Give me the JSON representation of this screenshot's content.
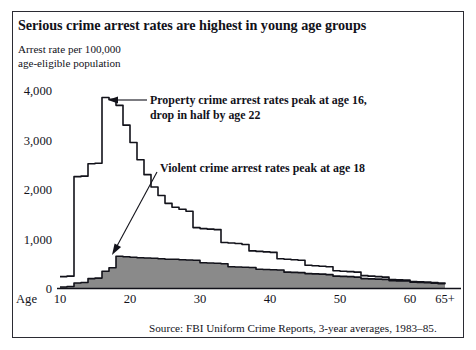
{
  "figure": {
    "title": "Serious crime arrest rates are highest in young age groups",
    "axis_caption_line1": "Arrest rate per 100,000",
    "axis_caption_line2": "age-eligible population",
    "source": "Source: FBI Uniform Crime Reports, 3-year averages, 1983–85.",
    "border_color": "#2b2b33",
    "background_color": "#ffffff"
  },
  "annotations": [
    {
      "id": "property-callout",
      "line1": "Property crime arrest rates peak at age 16,",
      "line2": "drop in half by age 22"
    },
    {
      "id": "violent-callout",
      "line1": "Violent crime arrest rates peak at age 18"
    }
  ],
  "chart_data": {
    "type": "line",
    "title": "Serious crime arrest rates are highest in young age groups",
    "xlabel": "Age",
    "ylabel": "Arrest rate per 100,000 age-eligible population",
    "xlim": [
      10,
      66
    ],
    "ylim": [
      0,
      4300
    ],
    "grid": false,
    "legend": "none",
    "x_prefix_label": "Age",
    "x_ticks": [
      10,
      20,
      30,
      40,
      50,
      60,
      65
    ],
    "x_tick_labels": [
      "10",
      "20",
      "30",
      "40",
      "50",
      "60",
      "65+"
    ],
    "y_ticks": [
      0,
      1000,
      2000,
      3000,
      4000
    ],
    "y_tick_labels": [
      "0",
      "1,000",
      "2,000",
      "3,000",
      "4,000"
    ],
    "x": [
      10,
      11,
      12,
      13,
      14,
      15,
      16,
      17,
      18,
      19,
      20,
      21,
      22,
      23,
      24,
      25,
      26,
      27,
      28,
      29,
      30,
      31,
      32,
      33,
      34,
      35,
      36,
      37,
      38,
      39,
      40,
      41,
      42,
      43,
      44,
      45,
      46,
      47,
      48,
      49,
      50,
      51,
      52,
      53,
      54,
      55,
      56,
      57,
      58,
      59,
      60,
      61,
      62,
      63,
      64,
      65
    ],
    "series": [
      {
        "name": "Property crime arrest rate",
        "color": "#12121a",
        "fill": "none",
        "values": [
          240,
          250,
          2260,
          2270,
          2520,
          2530,
          3860,
          3820,
          3700,
          3300,
          2950,
          2600,
          2300,
          2050,
          1880,
          1720,
          1640,
          1600,
          1560,
          1230,
          1210,
          1200,
          1190,
          930,
          920,
          910,
          890,
          760,
          750,
          740,
          730,
          600,
          590,
          580,
          570,
          470,
          460,
          450,
          440,
          360,
          350,
          340,
          330,
          260,
          250,
          240,
          230,
          180,
          175,
          170,
          140,
          135,
          130,
          120,
          110,
          100
        ]
      },
      {
        "name": "Violent crime arrest rate",
        "color": "#12121a",
        "fill": "#8a8a8a",
        "values": [
          30,
          40,
          110,
          120,
          200,
          210,
          350,
          420,
          650,
          640,
          630,
          620,
          615,
          610,
          600,
          590,
          590,
          580,
          575,
          570,
          520,
          515,
          510,
          500,
          440,
          435,
          430,
          425,
          390,
          385,
          380,
          375,
          330,
          325,
          320,
          300,
          295,
          290,
          280,
          250,
          245,
          240,
          230,
          200,
          195,
          190,
          185,
          160,
          155,
          150,
          125,
          120,
          115,
          105,
          95,
          85
        ]
      }
    ],
    "notes": [
      "Property crime arrest rates peak at age 16, drop in half by age 22",
      "Violent crime arrest rates peak at age 18"
    ]
  }
}
